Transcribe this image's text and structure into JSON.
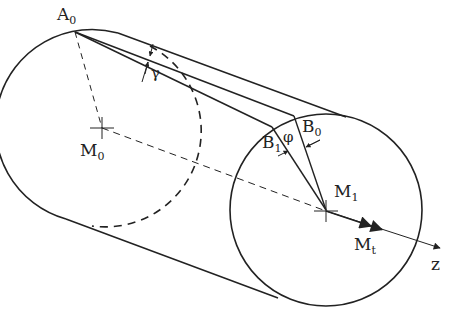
{
  "diagram": {
    "stroke_color": "#222222",
    "background": "#ffffff",
    "labels": {
      "A0": {
        "main": "A",
        "sub": "0"
      },
      "M0": {
        "main": "M",
        "sub": "0"
      },
      "M1": {
        "main": "M",
        "sub": "1"
      },
      "B0": {
        "main": "B",
        "sub": "0"
      },
      "B1": {
        "main": "B",
        "sub": "1"
      },
      "Mt": {
        "main": "M",
        "sub": "t"
      },
      "gamma": "γ",
      "phi": "φ",
      "z": "z"
    },
    "geometry": {
      "left_circle_center": [
        100,
        128
      ],
      "right_circle_center": [
        326,
        210
      ],
      "radius": 96,
      "point_A0": [
        75,
        32
      ],
      "point_B0": [
        294,
        116
      ],
      "point_B1": [
        272,
        127
      ]
    }
  }
}
